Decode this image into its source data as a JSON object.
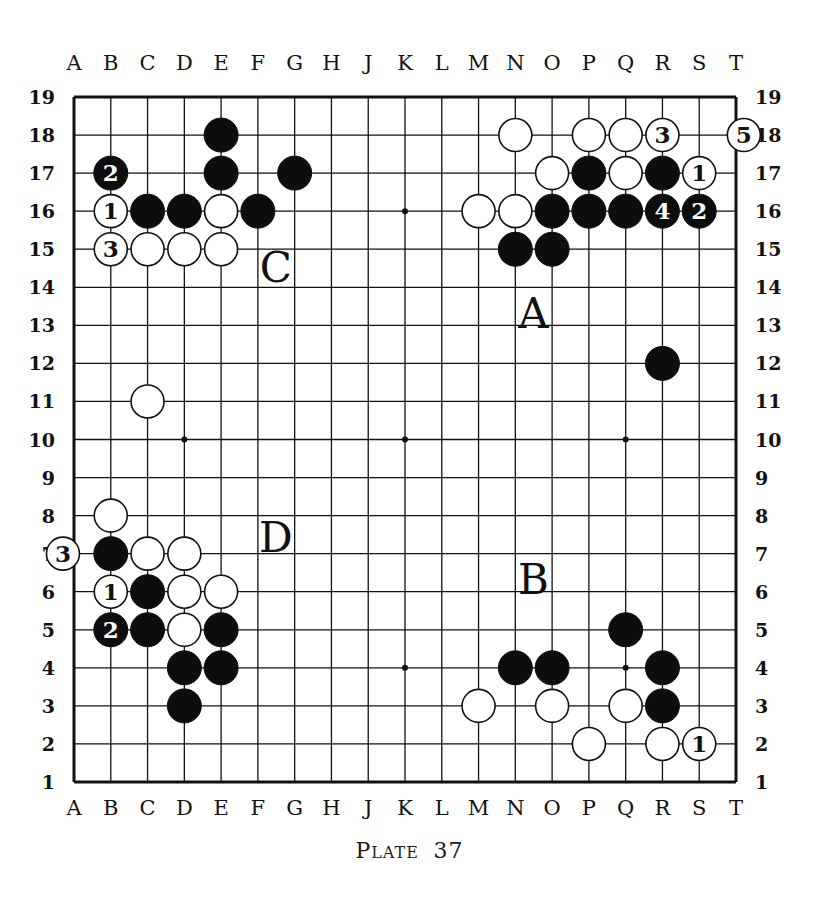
{
  "board": {
    "size": 19,
    "columns": [
      "A",
      "B",
      "C",
      "D",
      "E",
      "F",
      "G",
      "H",
      "J",
      "K",
      "L",
      "M",
      "N",
      "O",
      "P",
      "Q",
      "R",
      "S",
      "T"
    ],
    "rows": [
      19,
      18,
      17,
      16,
      15,
      14,
      13,
      12,
      11,
      10,
      9,
      8,
      7,
      6,
      5,
      4,
      3,
      2,
      1
    ],
    "star_points": [
      "D16",
      "K16",
      "Q16",
      "D10",
      "K10",
      "Q10",
      "D4",
      "K4",
      "Q4"
    ],
    "stones": [
      {
        "color": "black",
        "pos": "E18"
      },
      {
        "color": "black",
        "pos": "E17"
      },
      {
        "color": "black",
        "pos": "G17"
      },
      {
        "color": "black",
        "pos": "B17",
        "label": "2"
      },
      {
        "color": "white",
        "pos": "B16",
        "label": "1"
      },
      {
        "color": "black",
        "pos": "C16"
      },
      {
        "color": "black",
        "pos": "D16"
      },
      {
        "color": "white",
        "pos": "E16"
      },
      {
        "color": "black",
        "pos": "F16"
      },
      {
        "color": "white",
        "pos": "B15",
        "label": "3"
      },
      {
        "color": "white",
        "pos": "C15"
      },
      {
        "color": "white",
        "pos": "D15"
      },
      {
        "color": "white",
        "pos": "E15"
      },
      {
        "color": "white",
        "pos": "N18"
      },
      {
        "color": "white",
        "pos": "P18"
      },
      {
        "color": "white",
        "pos": "Q18"
      },
      {
        "color": "white",
        "pos": "R18",
        "label": "3"
      },
      {
        "color": "white",
        "pos": "OFF_RIGHT_18",
        "label": "5"
      },
      {
        "color": "white",
        "pos": "O17"
      },
      {
        "color": "black",
        "pos": "P17"
      },
      {
        "color": "white",
        "pos": "Q17"
      },
      {
        "color": "black",
        "pos": "R17"
      },
      {
        "color": "white",
        "pos": "S17",
        "label": "1"
      },
      {
        "color": "white",
        "pos": "M16"
      },
      {
        "color": "white",
        "pos": "N16"
      },
      {
        "color": "black",
        "pos": "O16"
      },
      {
        "color": "black",
        "pos": "P16"
      },
      {
        "color": "black",
        "pos": "Q16"
      },
      {
        "color": "black",
        "pos": "R16",
        "label": "4"
      },
      {
        "color": "black",
        "pos": "S16",
        "label": "2"
      },
      {
        "color": "black",
        "pos": "N15"
      },
      {
        "color": "black",
        "pos": "O15"
      },
      {
        "color": "black",
        "pos": "R12"
      },
      {
        "color": "white",
        "pos": "C11"
      },
      {
        "color": "white",
        "pos": "B8"
      },
      {
        "color": "white",
        "pos": "OFF_LEFT_7",
        "label": "3"
      },
      {
        "color": "black",
        "pos": "B7"
      },
      {
        "color": "white",
        "pos": "C7"
      },
      {
        "color": "white",
        "pos": "D7"
      },
      {
        "color": "white",
        "pos": "B6",
        "label": "1"
      },
      {
        "color": "black",
        "pos": "C6"
      },
      {
        "color": "white",
        "pos": "D6"
      },
      {
        "color": "white",
        "pos": "E6"
      },
      {
        "color": "black",
        "pos": "B5",
        "label": "2"
      },
      {
        "color": "black",
        "pos": "C5"
      },
      {
        "color": "white",
        "pos": "D5"
      },
      {
        "color": "black",
        "pos": "E5"
      },
      {
        "color": "black",
        "pos": "D4"
      },
      {
        "color": "black",
        "pos": "E4"
      },
      {
        "color": "black",
        "pos": "D3"
      },
      {
        "color": "black",
        "pos": "Q5"
      },
      {
        "color": "black",
        "pos": "N4"
      },
      {
        "color": "black",
        "pos": "O4"
      },
      {
        "color": "black",
        "pos": "R4"
      },
      {
        "color": "white",
        "pos": "M3"
      },
      {
        "color": "white",
        "pos": "O3"
      },
      {
        "color": "white",
        "pos": "Q3"
      },
      {
        "color": "black",
        "pos": "R3"
      },
      {
        "color": "white",
        "pos": "P2"
      },
      {
        "color": "white",
        "pos": "R2"
      },
      {
        "color": "white",
        "pos": "S2",
        "label": "1"
      }
    ],
    "region_labels": [
      {
        "text": "C",
        "pos": "F14.5"
      },
      {
        "text": "A",
        "pos": "N13.3"
      },
      {
        "text": "D",
        "pos": "F7.4"
      },
      {
        "text": "B",
        "pos": "N6.3"
      }
    ]
  },
  "caption": {
    "plate_first": "P",
    "plate_rest": "LATE",
    "number": "37"
  }
}
